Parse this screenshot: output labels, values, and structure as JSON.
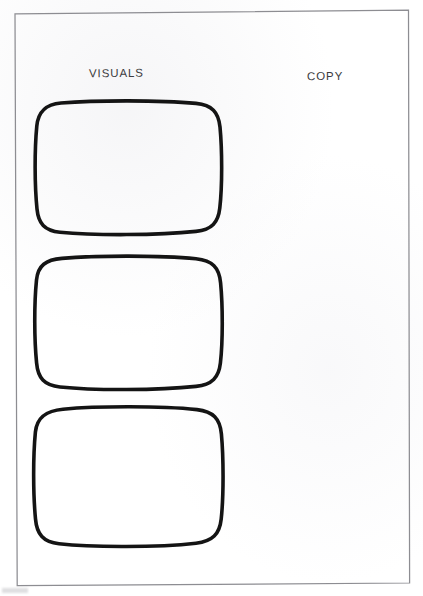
{
  "document": {
    "kind": "storyboard-template",
    "title": "Storyboard Template",
    "paper_color": "#ffffff",
    "border_color": "#8d8d92",
    "ink_color": "#111111",
    "label_color": "#3c3c40"
  },
  "columns": [
    {
      "id": "visuals",
      "label": "VISUALS"
    },
    {
      "id": "copy",
      "label": "COPY"
    }
  ],
  "panels": [
    {
      "index": 1,
      "visual_caption": "",
      "copy_text": ""
    },
    {
      "index": 2,
      "visual_caption": "",
      "copy_text": ""
    },
    {
      "index": 3,
      "visual_caption": "",
      "copy_text": ""
    }
  ]
}
